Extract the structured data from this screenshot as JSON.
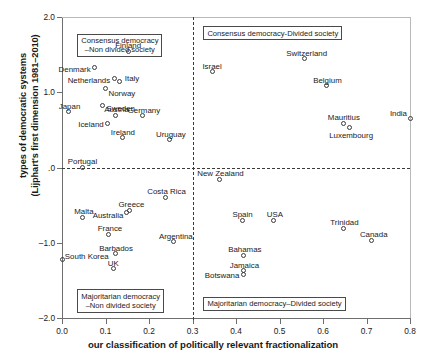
{
  "chart_data": {
    "type": "scatter",
    "title": "",
    "xlabel": "our classification of politically relevant fractionalization",
    "ylabel_line1": "types of democratic systems",
    "ylabel_line2": "(Lijphart's first dimension 1981–2010)",
    "xlim": [
      0.0,
      0.8
    ],
    "ylim": [
      -2.0,
      2.0
    ],
    "xticks": [
      "0.0",
      "0.1",
      "0.2",
      "0.3",
      "0.4",
      "0.5",
      "0.6",
      "0.7",
      "0.8"
    ],
    "xtick_values": [
      0.0,
      0.1,
      0.2,
      0.3,
      0.4,
      0.5,
      0.6,
      0.7,
      0.8
    ],
    "yticks": [
      "2.0",
      "1.0",
      ".0",
      "–1.0",
      "–2.0"
    ],
    "ytick_values": [
      2.0,
      1.0,
      0.0,
      -1.0,
      -2.0
    ],
    "grid": false,
    "legend": "none",
    "reference_lines": {
      "vertical_x": 0.3,
      "horizontal_y": 0.0,
      "style": "dashed"
    },
    "quadrant_labels": [
      {
        "name": "consensus-non-divided",
        "line1": "Consensus democracy",
        "line2": "–Non divided society",
        "x": 0.035,
        "y": 1.78
      },
      {
        "name": "consensus-divided",
        "line1": "Consensus democracy-Divided society",
        "line2": "",
        "x": 0.325,
        "y": 1.88
      },
      {
        "name": "majoritarian-non-divided",
        "line1": "Majoritarian democracy",
        "line2": "–Non divided society",
        "x": 0.035,
        "y": -1.62
      },
      {
        "name": "majoritarian-divided",
        "line1": "Majoritarian democracy–Divided society",
        "line2": "",
        "x": 0.325,
        "y": -1.72
      }
    ],
    "points": [
      {
        "label": "Finland",
        "x": 0.152,
        "y": 1.545,
        "lpos": "center",
        "ldx": 0,
        "ldy": -9
      },
      {
        "label": "Denmark",
        "x": 0.075,
        "y": 1.335,
        "lpos": "right",
        "ldx": -4,
        "ldy": -1
      },
      {
        "label": "Netherlands",
        "x": 0.12,
        "y": 1.185,
        "lpos": "right",
        "ldx": -4,
        "ldy": -1
      },
      {
        "label": "Italy",
        "x": 0.133,
        "y": 1.145,
        "lpos": "left",
        "ldx": 5,
        "ldy": -6
      },
      {
        "label": "Norway",
        "x": 0.1,
        "y": 1.045,
        "lpos": "left",
        "ldx": 3,
        "ldy": 1
      },
      {
        "label": "Sweden",
        "x": 0.093,
        "y": 0.82,
        "lpos": "left",
        "ldx": 4,
        "ldy": -1
      },
      {
        "label": "Japan",
        "x": 0.015,
        "y": 0.74,
        "lpos": "center",
        "ldx": 1,
        "ldy": -9
      },
      {
        "label": "Austria",
        "x": 0.123,
        "y": 0.695,
        "lpos": "center",
        "ldx": 1,
        "ldy": -9
      },
      {
        "label": "Germany",
        "x": 0.186,
        "y": 0.69,
        "lpos": "center",
        "ldx": 1,
        "ldy": -9
      },
      {
        "label": "Iceland",
        "x": 0.105,
        "y": 0.59,
        "lpos": "right",
        "ldx": -4,
        "ldy": -2
      },
      {
        "label": "Ireland",
        "x": 0.14,
        "y": 0.395,
        "lpos": "center",
        "ldx": 0,
        "ldy": -9
      },
      {
        "label": "Uruguay",
        "x": 0.248,
        "y": 0.37,
        "lpos": "center",
        "ldx": 1,
        "ldy": -9
      },
      {
        "label": "Portugal",
        "x": 0.047,
        "y": 0.005,
        "lpos": "center",
        "ldx": 0,
        "ldy": -9
      },
      {
        "label": "Israel",
        "x": 0.345,
        "y": 1.27,
        "lpos": "center",
        "ldx": 0,
        "ldy": -9
      },
      {
        "label": "Switzerland",
        "x": 0.558,
        "y": 1.445,
        "lpos": "center",
        "ldx": 2,
        "ldy": -9
      },
      {
        "label": "Belgium",
        "x": 0.608,
        "y": 1.085,
        "lpos": "center",
        "ldx": 1,
        "ldy": -9
      },
      {
        "label": "Mauritius",
        "x": 0.648,
        "y": 0.59,
        "lpos": "center",
        "ldx": 0,
        "ldy": -9
      },
      {
        "label": "Luxembourg",
        "x": 0.66,
        "y": 0.53,
        "lpos": "center",
        "ldx": 2,
        "ldy": 4
      },
      {
        "label": "India",
        "x": 0.8,
        "y": 0.655,
        "lpos": "right",
        "ldx": -3,
        "ldy": -8
      },
      {
        "label": "New Zealand",
        "x": 0.362,
        "y": -0.155,
        "lpos": "center",
        "ldx": 1,
        "ldy": -9
      },
      {
        "label": "Costa Rica",
        "x": 0.238,
        "y": -0.395,
        "lpos": "center",
        "ldx": 1,
        "ldy": -9
      },
      {
        "label": "Greece",
        "x": 0.155,
        "y": -0.565,
        "lpos": "center",
        "ldx": 2,
        "ldy": -9
      },
      {
        "label": "Australia",
        "x": 0.148,
        "y": -0.6,
        "lpos": "right",
        "ldx": -3,
        "ldy": -1
      },
      {
        "label": "Malta",
        "x": 0.048,
        "y": -0.66,
        "lpos": "center",
        "ldx": 1,
        "ldy": -9
      },
      {
        "label": "France",
        "x": 0.108,
        "y": -0.89,
        "lpos": "center",
        "ldx": 1,
        "ldy": -9
      },
      {
        "label": "Spain",
        "x": 0.415,
        "y": -0.7,
        "lpos": "center",
        "ldx": 0,
        "ldy": -9
      },
      {
        "label": "USA",
        "x": 0.487,
        "y": -0.7,
        "lpos": "center",
        "ldx": 1,
        "ldy": -9
      },
      {
        "label": "Argentina",
        "x": 0.257,
        "y": -0.985,
        "lpos": "center",
        "ldx": 2,
        "ldy": -9
      },
      {
        "label": "Trinidad",
        "x": 0.647,
        "y": -0.805,
        "lpos": "center",
        "ldx": 1,
        "ldy": -9
      },
      {
        "label": "Canada",
        "x": 0.712,
        "y": -0.965,
        "lpos": "center",
        "ldx": 2,
        "ldy": -9
      },
      {
        "label": "Barbados",
        "x": 0.122,
        "y": -1.145,
        "lpos": "center",
        "ldx": 1,
        "ldy": -9
      },
      {
        "label": "South Korea",
        "x": 0.002,
        "y": -1.225,
        "lpos": "left",
        "ldx": 2,
        "ldy": -7
      },
      {
        "label": "UK",
        "x": 0.118,
        "y": -1.345,
        "lpos": "center",
        "ldx": 0,
        "ldy": -9
      },
      {
        "label": "Bahamas",
        "x": 0.418,
        "y": -1.165,
        "lpos": "center",
        "ldx": 1,
        "ldy": -9
      },
      {
        "label": "Jamaica",
        "x": 0.417,
        "y": -1.37,
        "lpos": "center",
        "ldx": 1,
        "ldy": -9
      },
      {
        "label": "Botswana",
        "x": 0.417,
        "y": -1.42,
        "lpos": "right",
        "ldx": -4,
        "ldy": -2
      }
    ]
  }
}
